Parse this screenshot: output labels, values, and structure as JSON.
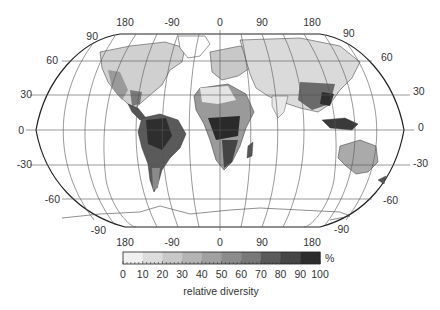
{
  "figure": {
    "type": "world diversity map",
    "projection": "Robinson",
    "top_lon_labels": [
      "180",
      "-90",
      "0",
      "90",
      "180"
    ],
    "bottom_lon_labels": [
      "180",
      "-90",
      "0",
      "90",
      "180"
    ],
    "left_lat_labels": [
      "90",
      "60",
      "30",
      "0",
      "-30",
      "-60",
      "-90"
    ],
    "right_lat_labels": [
      "90",
      "60",
      "30",
      "0",
      "-30",
      "-60",
      "-90"
    ]
  },
  "colorbar": {
    "ticks": [
      "0",
      "10",
      "20",
      "30",
      "40",
      "50",
      "60",
      "70",
      "80",
      "90",
      "100"
    ],
    "unit": "%",
    "label": "relative diversity",
    "colors": [
      "#f0f0f0",
      "#dcdcdc",
      "#c8c8c8",
      "#b4b4b4",
      "#a0a0a0",
      "#8c8c8c",
      "#787878",
      "#5a5a5a",
      "#464646",
      "#2d2d2d"
    ]
  },
  "colors": {
    "land_low": "#e2e2e2",
    "land_mid": "#a8a8a8",
    "land_high": "#3a3a3a",
    "graticule": "#555555",
    "outline": "#222222"
  }
}
